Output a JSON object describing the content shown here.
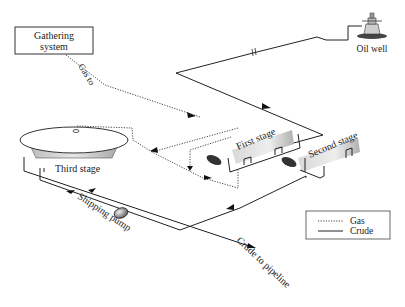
{
  "diagram": {
    "labels": {
      "gathering_system_line1": "Gathering",
      "gathering_system_line2": "system",
      "gas_to": "Gas to",
      "oil_well": "Oil well",
      "first_stage": "First stage",
      "second_stage": "Second stage",
      "third_stage": "Third stage",
      "shipping_pump": "Shipping pump",
      "crude_to_pipeline": "Crude to pipeline"
    },
    "legend": {
      "items": [
        {
          "style": "dotted",
          "label": "Gas"
        },
        {
          "style": "solid",
          "label": "Crude"
        }
      ]
    },
    "colors": {
      "line": "#222222",
      "separator_fill": "#c8c8c8",
      "pump_fill": "#9a9a9a",
      "background": "#ffffff"
    }
  }
}
